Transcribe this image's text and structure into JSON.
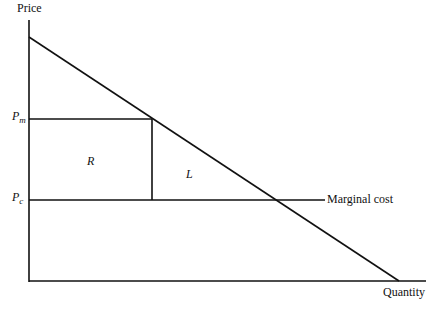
{
  "diagram": {
    "y_axis_label": "Price",
    "x_axis_label": "Quantity",
    "price_labels": {
      "pm_main": "P",
      "pm_sub": "m",
      "pc_main": "P",
      "pc_sub": "c"
    },
    "region_labels": {
      "rectangle": "R",
      "triangle": "L"
    },
    "curve_labels": {
      "marginal_cost": "Marginal cost"
    }
  }
}
